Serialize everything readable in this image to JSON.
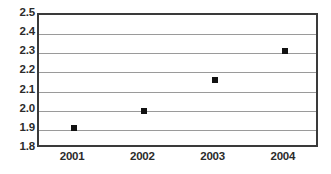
{
  "chart_data": {
    "type": "scatter",
    "title": "",
    "subtitle": "",
    "xlabel": "",
    "ylabel": "",
    "categories": [
      "2001",
      "2002",
      "2003",
      "2004"
    ],
    "x": [
      2001,
      2002,
      2003,
      2004
    ],
    "values": [
      1.91,
      2.0,
      2.16,
      2.31
    ],
    "series": [
      {
        "name": "",
        "values": [
          1.91,
          2.0,
          2.16,
          2.31
        ]
      }
    ],
    "ylim": [
      1.8,
      2.5
    ],
    "ytick_labels": [
      "2.5",
      "2.4",
      "2.3",
      "2.2",
      "2.1",
      "2.0",
      "1.9",
      "1.8"
    ],
    "ytick_values": [
      2.5,
      2.4,
      2.3,
      2.2,
      2.1,
      2.0,
      1.9,
      1.8
    ],
    "ytick_step": 0.1,
    "xtick_labels": [
      "2001",
      "2002",
      "2003",
      "2004"
    ],
    "grid": true,
    "grid_axis": "y",
    "legend": false,
    "legend_position": "none",
    "marker": "square",
    "marker_color": "#121212",
    "gridline_color": "#9a9a9a",
    "axis_border_color": "#3a3a3a",
    "background_color": "#ffffff",
    "annotations": []
  }
}
